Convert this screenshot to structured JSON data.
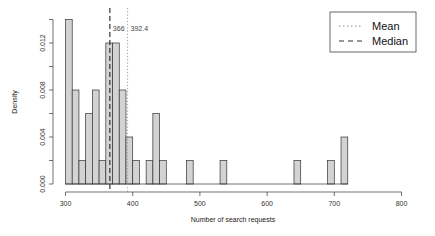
{
  "chart_data": {
    "type": "bar",
    "subtype": "histogram",
    "title": "",
    "xlabel": "Number of search requests",
    "ylabel": "Density",
    "xlim": [
      300,
      800
    ],
    "ylim": [
      0,
      0.014
    ],
    "bin_width": 10,
    "x_ticks": [
      300,
      400,
      500,
      600,
      700,
      800
    ],
    "x_tick_labels": [
      "300",
      "400",
      "500",
      "600",
      "700",
      "800"
    ],
    "y_ticks": [
      0.0,
      0.004,
      0.008,
      0.012
    ],
    "y_tick_labels": [
      "0.000",
      "0.004",
      "0.008",
      "0.012"
    ],
    "y_minor_ticks": [
      0.002,
      0.006,
      0.01,
      0.014
    ],
    "grid": false,
    "bins": [
      {
        "start": 300,
        "end": 310,
        "density": 0.014
      },
      {
        "start": 310,
        "end": 320,
        "density": 0.008
      },
      {
        "start": 320,
        "end": 330,
        "density": 0.002
      },
      {
        "start": 330,
        "end": 340,
        "density": 0.006
      },
      {
        "start": 340,
        "end": 350,
        "density": 0.008
      },
      {
        "start": 350,
        "end": 360,
        "density": 0.002
      },
      {
        "start": 360,
        "end": 370,
        "density": 0.012
      },
      {
        "start": 370,
        "end": 380,
        "density": 0.012
      },
      {
        "start": 380,
        "end": 390,
        "density": 0.008
      },
      {
        "start": 390,
        "end": 400,
        "density": 0.004
      },
      {
        "start": 400,
        "end": 410,
        "density": 0.002
      },
      {
        "start": 410,
        "end": 420,
        "density": 0.0
      },
      {
        "start": 420,
        "end": 430,
        "density": 0.002
      },
      {
        "start": 430,
        "end": 440,
        "density": 0.006
      },
      {
        "start": 440,
        "end": 450,
        "density": 0.002
      },
      {
        "start": 480,
        "end": 490,
        "density": 0.002
      },
      {
        "start": 530,
        "end": 540,
        "density": 0.002
      },
      {
        "start": 640,
        "end": 650,
        "density": 0.002
      },
      {
        "start": 690,
        "end": 700,
        "density": 0.002
      },
      {
        "start": 710,
        "end": 720,
        "density": 0.004
      }
    ],
    "reference_lines": [
      {
        "name": "Mean",
        "value": 392.4,
        "label": "392.4",
        "style": "dotted"
      },
      {
        "name": "Median",
        "value": 366,
        "label": "366",
        "style": "dashed"
      }
    ],
    "legend": {
      "position": "top-right",
      "entries": [
        {
          "label": "Mean",
          "style": "dotted"
        },
        {
          "label": "Median",
          "style": "dashed"
        }
      ]
    },
    "colors": {
      "bar_fill": "#d3d3d3",
      "bar_stroke": "#333333",
      "axis": "#333333"
    }
  }
}
